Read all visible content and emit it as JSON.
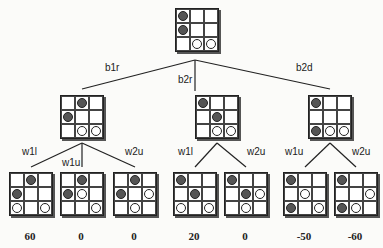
{
  "root": {
    "x": 175,
    "y": 8,
    "cells": [
      "B",
      "",
      "",
      "B",
      "",
      "",
      "",
      "W",
      "W"
    ]
  },
  "level1": [
    {
      "x": 60,
      "y": 95,
      "cells": [
        "",
        "B",
        "",
        "B",
        "",
        "",
        "",
        "W",
        "W"
      ],
      "edge_label": "b1r",
      "label_x": 105,
      "label_y": 62
    },
    {
      "x": 195,
      "y": 95,
      "cells": [
        "B",
        "",
        "",
        "",
        "B",
        "",
        "",
        "W",
        "W"
      ],
      "edge_label": "b2r",
      "label_x": 178,
      "label_y": 74
    },
    {
      "x": 308,
      "y": 95,
      "cells": [
        "B",
        "",
        "",
        "",
        "",
        "",
        "B",
        "W",
        "W"
      ],
      "edge_label": "b2d",
      "label_x": 296,
      "label_y": 62
    }
  ],
  "leaves": [
    {
      "x": 9,
      "y": 172,
      "cells": [
        "",
        "B",
        "",
        "B",
        "",
        "",
        "W",
        "",
        "W"
      ],
      "edge_label": "w1l",
      "label_x": 22,
      "label_y": 146,
      "score": "60"
    },
    {
      "x": 60,
      "y": 172,
      "cells": [
        "",
        "B",
        "",
        "B",
        "W",
        "",
        "",
        "",
        "W"
      ],
      "edge_label": "w1u",
      "label_x": 62,
      "label_y": 157,
      "score": "0"
    },
    {
      "x": 113,
      "y": 172,
      "cells": [
        "",
        "B",
        "",
        "B",
        "",
        "W",
        "",
        "W",
        ""
      ],
      "edge_label": "w2u",
      "label_x": 125,
      "label_y": 146,
      "score": "0"
    },
    {
      "x": 173,
      "y": 172,
      "cells": [
        "B",
        "",
        "",
        "",
        "B",
        "",
        "W",
        "",
        "W"
      ],
      "edge_label": "w1l",
      "label_x": 178,
      "label_y": 146,
      "score": "20"
    },
    {
      "x": 224,
      "y": 172,
      "cells": [
        "B",
        "",
        "",
        "",
        "B",
        "W",
        "",
        "W",
        ""
      ],
      "edge_label": "w2u",
      "label_x": 247,
      "label_y": 146,
      "score": "0"
    },
    {
      "x": 283,
      "y": 172,
      "cells": [
        "B",
        "",
        "",
        "",
        "W",
        "",
        "B",
        "",
        "W"
      ],
      "edge_label": "w1u",
      "label_x": 285,
      "label_y": 146,
      "score": "-50"
    },
    {
      "x": 334,
      "y": 172,
      "cells": [
        "B",
        "",
        "",
        "",
        "",
        "W",
        "B",
        "W",
        ""
      ],
      "edge_label": "w2u",
      "label_x": 352,
      "label_y": 146,
      "score": "-60"
    }
  ]
}
